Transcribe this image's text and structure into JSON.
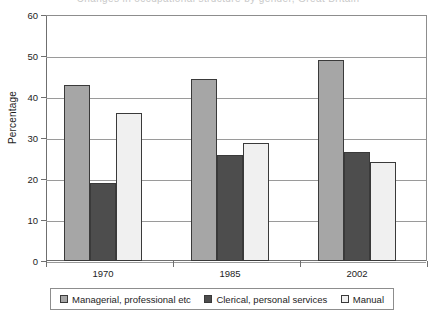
{
  "figure": {
    "clipped_title": "Changes in occupational structure by gender, Great Britain"
  },
  "chart_data": {
    "type": "bar",
    "title": "",
    "xlabel": "",
    "ylabel": "Percentage",
    "categories": [
      "1970",
      "1985",
      "2002"
    ],
    "ylim": [
      0,
      60
    ],
    "yticks": [
      0,
      10,
      20,
      30,
      40,
      50,
      60
    ],
    "grid": true,
    "legend_position": "bottom",
    "series": [
      {
        "name": "Managerial, professional etc",
        "color": "#a6a6a6",
        "values": [
          43.0,
          44.4,
          49.0
        ]
      },
      {
        "name": "Clerical, personal services",
        "color": "#4d4d4d",
        "values": [
          19.1,
          25.8,
          26.5
        ]
      },
      {
        "name": "Manual",
        "color": "#f0f0f0",
        "values": [
          36.2,
          28.8,
          24.1
        ]
      }
    ]
  },
  "axis": {
    "y_labels": [
      "60",
      "50",
      "40",
      "30",
      "20",
      "10",
      "0"
    ],
    "y_title": "Percentage",
    "x_labels": [
      "1970",
      "1985",
      "2002"
    ]
  },
  "legend": {
    "items": [
      {
        "label": "Managerial, professional etc",
        "swatch": "#a6a6a6"
      },
      {
        "label": "Clerical, personal services",
        "swatch": "#4d4d4d"
      },
      {
        "label": "Manual",
        "swatch": "#f0f0f0"
      }
    ]
  }
}
